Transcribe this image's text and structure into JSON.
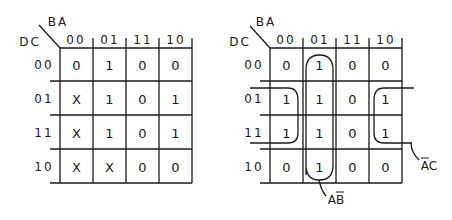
{
  "left_map": {
    "col_var_label": "BA",
    "row_var_label": "DC",
    "col_headers": [
      "00",
      "01",
      "11",
      "10"
    ],
    "row_headers": [
      "00",
      "01",
      "11",
      "10"
    ],
    "rows": [
      [
        "0",
        "1",
        "0",
        "0"
      ],
      [
        "X",
        "1",
        "0",
        "1"
      ],
      [
        "X",
        "1",
        "0",
        "1"
      ],
      [
        "X",
        "X",
        "0",
        "0"
      ]
    ]
  },
  "right_map": {
    "col_var_label": "BA",
    "row_var_label": "DC",
    "col_headers": [
      "00",
      "01",
      "11",
      "10"
    ],
    "row_headers": [
      "00",
      "01",
      "11",
      "10"
    ],
    "rows": [
      [
        "0",
        "1",
        "0",
        "0"
      ],
      [
        "1",
        "1",
        "0",
        "1"
      ],
      [
        "1",
        "1",
        "0",
        "1"
      ],
      [
        "0",
        "1",
        "0",
        "0"
      ]
    ],
    "groups": [
      {
        "label_plain": "A",
        "label_bar": "B",
        "covers": "column BA=01, all rows"
      },
      {
        "label_bar": "A",
        "label_plain": "C",
        "covers": "rows DC=01,11; columns BA=00,10 (wrap-around)"
      }
    ]
  },
  "colors": {
    "line": "#1a1a1a",
    "background": "#ffffff"
  }
}
